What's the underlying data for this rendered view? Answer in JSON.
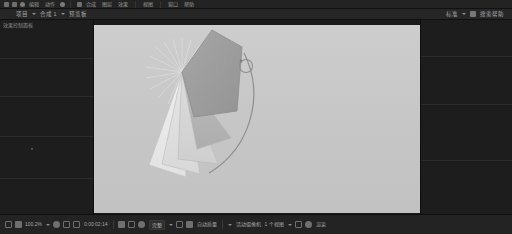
{
  "app": {
    "title": "动画编辑器",
    "bg_color": "#1c1c1c",
    "accent_color": "#6f6f6f"
  },
  "menubar": {
    "icons": [
      "app-logo-icon",
      "stop-icon",
      "layers-icon"
    ],
    "items": [
      {
        "label": "编辑"
      },
      {
        "label": "动作"
      },
      {
        "label": "合成"
      },
      {
        "label": "图层"
      },
      {
        "label": "效果"
      },
      {
        "label": "视图"
      },
      {
        "label": "窗口"
      },
      {
        "label": "帮助"
      }
    ]
  },
  "toolbar": {
    "left": {
      "project_label": "项目",
      "comp_label": "合成 1",
      "view_label": "预览板"
    },
    "right": {
      "workspace_label": "标准",
      "search_label": "搜索帮助"
    }
  },
  "panels": {
    "left_label": "效果控制面板",
    "left_rows": 4,
    "right_rows": 3
  },
  "canvas": {
    "background": "#c9c9c9",
    "width": 326,
    "height": 188
  },
  "shape": {
    "name": "扇形图层",
    "pivot_x": 176,
    "pivot_y": 113,
    "guide_line_count": 16,
    "sectors": [
      {
        "name": "sector-dark",
        "fill": "#9d9d9d",
        "opacity": 1.0
      },
      {
        "name": "sector-mid",
        "fill": "#b0b0b0",
        "opacity": 1.0
      },
      {
        "name": "sector-light1",
        "fill": "#d6d6d6",
        "opacity": 1.0
      },
      {
        "name": "sector-light2",
        "fill": "#e2e2e2",
        "opacity": 1.0
      },
      {
        "name": "sector-light3",
        "fill": "#ececec",
        "opacity": 1.0
      }
    ],
    "handle": {
      "name": "rotation-handle",
      "radius": 6
    }
  },
  "statusbar": {
    "zoom_value": "100.2%",
    "timecode": "0:00:02:14",
    "resolution_label": "完整",
    "quality_label": "自动质量",
    "camera_label": "活动摄像机",
    "view_count": "1 个视图",
    "render_label": "渲染",
    "buttons": [
      {
        "name": "grid-toggle-button",
        "label": ""
      },
      {
        "name": "safe-zone-button",
        "label": ""
      },
      {
        "name": "mask-toggle-button",
        "label": ""
      },
      {
        "name": "snapshot-button",
        "label": ""
      },
      {
        "name": "channel-button",
        "label": ""
      },
      {
        "name": "transparency-grid-button",
        "label": ""
      },
      {
        "name": "region-of-interest-button",
        "label": ""
      },
      {
        "name": "timeline-button",
        "label": ""
      },
      {
        "name": "preview-button",
        "label": ""
      },
      {
        "name": "settings-button",
        "label": ""
      }
    ]
  }
}
